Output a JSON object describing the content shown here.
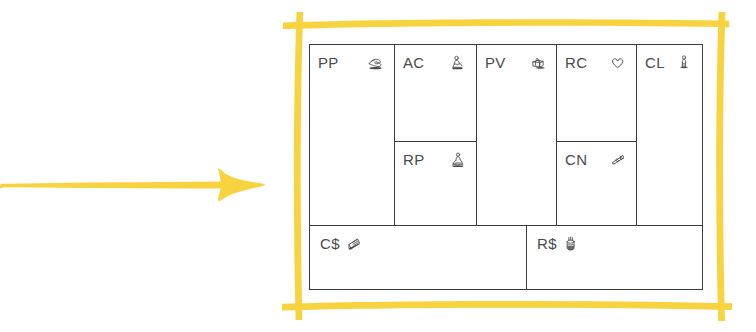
{
  "diagram": {
    "frame": {
      "name": "hand-drawn-yellow-frame",
      "color": "#F7D33F"
    },
    "arrow": {
      "name": "yellow-arrow-pointing-right",
      "color": "#F7D33F",
      "direction": "right"
    },
    "canvas": {
      "border_color": "#3b3b3b",
      "background": "#ffffff",
      "blocks": [
        {
          "key": "PP",
          "label": "PP",
          "icon": "partnership-handshake-icon",
          "position": "col1-full"
        },
        {
          "key": "AC",
          "label": "AC",
          "icon": "activities-person-icon",
          "position": "col2-top"
        },
        {
          "key": "RP",
          "label": "RP",
          "icon": "resources-person-icon",
          "position": "col2-bottom"
        },
        {
          "key": "PV",
          "label": "PV",
          "icon": "value-gift-package-icon",
          "position": "col3-full"
        },
        {
          "key": "RC",
          "label": "RC",
          "icon": "relationship-heart-icon",
          "position": "col4-top"
        },
        {
          "key": "CN",
          "label": "CN",
          "icon": "channels-scroll-icon",
          "position": "col4-bottom"
        },
        {
          "key": "CL",
          "label": "CL",
          "icon": "customer-person-icon",
          "position": "col5-full"
        },
        {
          "key": "C$",
          "label": "C$",
          "icon": "cost-receipt-icon",
          "position": "bottom-left"
        },
        {
          "key": "R$",
          "label": "R$",
          "icon": "revenue-money-hand-icon",
          "position": "bottom-right"
        }
      ]
    }
  }
}
